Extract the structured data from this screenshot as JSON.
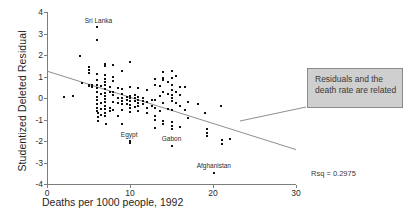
{
  "chart_data": {
    "type": "scatter",
    "title": "",
    "xlabel": "Deaths per 1000 people, 1992",
    "ylabel": "Studentized Deleted Residual",
    "xlim": [
      0,
      30
    ],
    "ylim": [
      -4,
      4
    ],
    "xticks": [
      "0",
      "10",
      "20",
      "30"
    ],
    "xtick_values": [
      0,
      10,
      20,
      30
    ],
    "yticks": [
      "4",
      "3",
      "2",
      "1",
      "0",
      "-1",
      "-2",
      "-3",
      "-4"
    ],
    "ytick_values": [
      4,
      3,
      2,
      1,
      0,
      -1,
      -2,
      -3,
      -4
    ],
    "grid": false,
    "legend": "none",
    "fit_line": {
      "x": [
        0,
        30
      ],
      "y": [
        1.25,
        -2.4
      ],
      "slope": -0.1217,
      "intercept": 1.25
    },
    "rsq_label": "Rsq = 0.2975",
    "rsq_value": 0.2975,
    "annotations": [
      {
        "text": "Sri Lanka",
        "x": 6.2,
        "y": 3.55
      },
      {
        "text": "Egypt",
        "x": 9.9,
        "y": -1.75
      },
      {
        "text": "Gabon",
        "x": 15.0,
        "y": -1.95
      },
      {
        "text": "Afghanistan",
        "x": 20.1,
        "y": -3.2
      }
    ],
    "points": [
      [
        2.0,
        0.05
      ],
      [
        3.1,
        0.1
      ],
      [
        4.0,
        1.97
      ],
      [
        4.2,
        0.72
      ],
      [
        5.0,
        1.45
      ],
      [
        5.0,
        1.3
      ],
      [
        5.0,
        1.15
      ],
      [
        5.0,
        0.6
      ],
      [
        5.05,
        0.55
      ],
      [
        5.4,
        0.62
      ],
      [
        5.4,
        0.5
      ],
      [
        6.0,
        3.3
      ],
      [
        6.0,
        2.7
      ],
      [
        6.0,
        1.1
      ],
      [
        6.0,
        0.85
      ],
      [
        6.0,
        0.6
      ],
      [
        6.0,
        0.45
      ],
      [
        6.0,
        0.3
      ],
      [
        6.0,
        0.05
      ],
      [
        6.0,
        -0.1
      ],
      [
        6.0,
        -0.28
      ],
      [
        6.0,
        -0.45
      ],
      [
        6.0,
        -0.6
      ],
      [
        6.1,
        -0.72
      ],
      [
        6.1,
        -0.9
      ],
      [
        6.1,
        -1.05
      ],
      [
        6.5,
        0.55
      ],
      [
        6.5,
        0.2
      ],
      [
        6.5,
        -0.22
      ],
      [
        6.5,
        -0.5
      ],
      [
        6.5,
        -0.78
      ],
      [
        7.0,
        1.6
      ],
      [
        7.0,
        1.5
      ],
      [
        7.0,
        1.05
      ],
      [
        7.0,
        0.9
      ],
      [
        7.0,
        0.75
      ],
      [
        7.0,
        0.6
      ],
      [
        7.0,
        0.42
      ],
      [
        7.0,
        0.25
      ],
      [
        7.0,
        0.1
      ],
      [
        7.0,
        -0.05
      ],
      [
        7.0,
        -0.2
      ],
      [
        7.0,
        -0.35
      ],
      [
        7.0,
        -0.52
      ],
      [
        7.0,
        -0.68
      ],
      [
        7.0,
        -0.85
      ],
      [
        7.05,
        -1.22
      ],
      [
        7.6,
        0.5
      ],
      [
        7.6,
        0.28
      ],
      [
        7.6,
        -0.45
      ],
      [
        7.6,
        -0.62
      ],
      [
        8.0,
        1.55
      ],
      [
        8.0,
        1.0
      ],
      [
        8.0,
        0.8
      ],
      [
        8.0,
        0.3
      ],
      [
        8.0,
        0.12
      ],
      [
        8.0,
        -0.18
      ],
      [
        8.0,
        -0.55
      ],
      [
        8.5,
        0.48
      ],
      [
        8.5,
        -0.02
      ],
      [
        8.5,
        -0.25
      ],
      [
        8.5,
        -0.82
      ],
      [
        9.0,
        1.25
      ],
      [
        9.0,
        0.4
      ],
      [
        9.0,
        0.18
      ],
      [
        9.0,
        0.0
      ],
      [
        9.0,
        -0.15
      ],
      [
        9.0,
        -0.3
      ],
      [
        9.0,
        -0.55
      ],
      [
        9.0,
        -1.2
      ],
      [
        9.6,
        0.05
      ],
      [
        9.6,
        -0.1
      ],
      [
        9.6,
        -0.28
      ],
      [
        10.0,
        1.68
      ],
      [
        10.0,
        0.52
      ],
      [
        10.0,
        0.1
      ],
      [
        10.0,
        -0.02
      ],
      [
        10.0,
        -0.15
      ],
      [
        10.0,
        -0.32
      ],
      [
        10.0,
        -0.48
      ],
      [
        10.0,
        -0.65
      ],
      [
        10.0,
        -2.0
      ],
      [
        10.0,
        -2.1
      ],
      [
        10.6,
        0.15
      ],
      [
        10.6,
        0.0
      ],
      [
        10.6,
        -0.12
      ],
      [
        10.6,
        -0.4
      ],
      [
        11.0,
        0.45
      ],
      [
        11.0,
        0.05
      ],
      [
        11.0,
        -0.08
      ],
      [
        11.0,
        -0.22
      ],
      [
        11.0,
        -0.38
      ],
      [
        11.0,
        -0.6
      ],
      [
        11.6,
        0.0
      ],
      [
        11.6,
        -0.15
      ],
      [
        11.6,
        -0.3
      ],
      [
        12.0,
        0.38
      ],
      [
        12.0,
        -0.18
      ],
      [
        12.0,
        -0.45
      ],
      [
        12.0,
        -0.72
      ],
      [
        12.6,
        -0.1
      ],
      [
        12.6,
        -0.35
      ],
      [
        13.0,
        0.9
      ],
      [
        13.0,
        0.62
      ],
      [
        13.0,
        -0.08
      ],
      [
        13.0,
        -0.45
      ],
      [
        13.0,
        -0.85
      ],
      [
        13.0,
        -1.0
      ],
      [
        13.0,
        -1.38
      ],
      [
        13.6,
        0.55
      ],
      [
        13.6,
        0.08
      ],
      [
        13.6,
        -0.6
      ],
      [
        14.0,
        1.2
      ],
      [
        14.0,
        0.95
      ],
      [
        14.0,
        0.85
      ],
      [
        14.0,
        0.28
      ],
      [
        14.0,
        -0.25
      ],
      [
        14.0,
        -1.08
      ],
      [
        14.0,
        -1.22
      ],
      [
        14.6,
        0.75
      ],
      [
        14.6,
        0.18
      ],
      [
        14.6,
        -0.5
      ],
      [
        15.0,
        1.25
      ],
      [
        15.0,
        0.95
      ],
      [
        15.0,
        0.6
      ],
      [
        15.0,
        0.35
      ],
      [
        15.0,
        0.15
      ],
      [
        15.0,
        0.0
      ],
      [
        15.0,
        -0.15
      ],
      [
        15.0,
        -0.55
      ],
      [
        15.0,
        -1.1
      ],
      [
        15.0,
        -1.28
      ],
      [
        15.0,
        -1.42
      ],
      [
        15.0,
        -2.25
      ],
      [
        15.6,
        1.02
      ],
      [
        15.6,
        0.3
      ],
      [
        15.6,
        -0.22
      ],
      [
        16.0,
        0.52
      ],
      [
        16.0,
        0.15
      ],
      [
        16.0,
        -0.38
      ],
      [
        16.0,
        -1.35
      ],
      [
        16.6,
        0.52
      ],
      [
        16.6,
        -0.55
      ],
      [
        17.0,
        -0.18
      ],
      [
        17.0,
        -0.92
      ],
      [
        18.2,
        -0.3
      ],
      [
        19.0,
        -0.72
      ],
      [
        19.3,
        -1.45
      ],
      [
        19.3,
        -1.62
      ],
      [
        19.3,
        -1.78
      ],
      [
        20.1,
        -3.5
      ],
      [
        21.0,
        -0.35
      ],
      [
        21.1,
        -1.95
      ],
      [
        21.1,
        -2.12
      ],
      [
        22.1,
        -1.92
      ]
    ]
  },
  "callout": {
    "text": "Residuals and the death rate are related",
    "background": "#cfcfcf",
    "border": "#8a8a8a"
  },
  "colors": {
    "point": "#111111",
    "axis": "#7d7d7d",
    "fit_line": "#8f8f8f",
    "text": "#2b2b2b"
  }
}
